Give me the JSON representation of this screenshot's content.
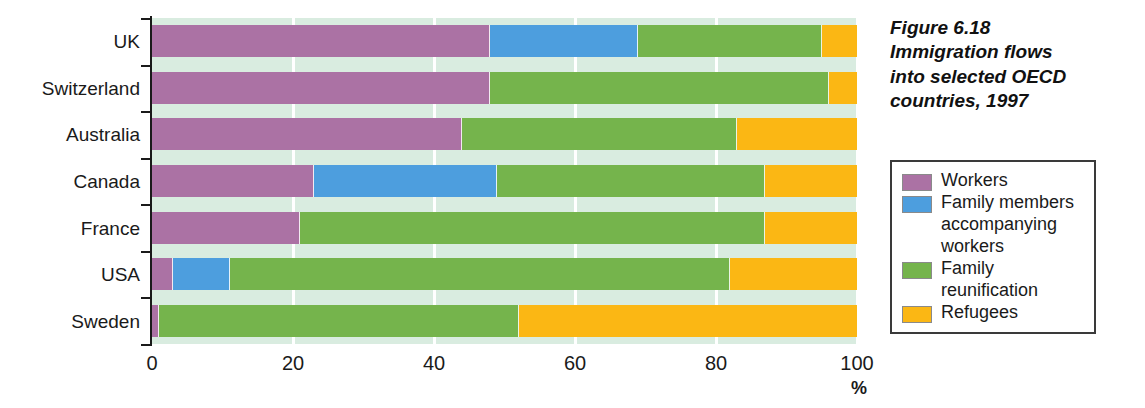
{
  "caption": {
    "line1": "Figure 6.18",
    "line2": "Immigration flows",
    "line3": "into selected OECD",
    "line4": "countries, 1997"
  },
  "legend": {
    "items": [
      {
        "label": "Workers",
        "key": "workers",
        "color": "#ab72a4"
      },
      {
        "label": "Family members",
        "label2": "accompanying",
        "label3": "workers",
        "key": "family-acc",
        "color": "#4d9ede"
      },
      {
        "label": "Family",
        "label2": "reunification",
        "key": "family-reu",
        "color": "#75b44c"
      },
      {
        "label": "Refugees",
        "key": "refugees",
        "color": "#fbb714"
      }
    ]
  },
  "axis": {
    "unit": "%",
    "ticks": [
      "0",
      "20",
      "40",
      "60",
      "80",
      "100"
    ]
  },
  "chart_data": {
    "type": "bar",
    "orientation": "horizontal",
    "stacked": true,
    "title": "Immigration flows into selected OECD countries, 1997",
    "xlabel": "%",
    "ylabel": "",
    "xlim": [
      0,
      100
    ],
    "xticks": [
      0,
      20,
      40,
      60,
      80,
      100
    ],
    "grid": true,
    "legend_position": "right",
    "categories": [
      "UK",
      "Switzerland",
      "Australia",
      "Canada",
      "France",
      "USA",
      "Sweden"
    ],
    "series": [
      {
        "name": "Workers",
        "color": "#ab72a4",
        "values": [
          48,
          48,
          44,
          23,
          21,
          3,
          1
        ]
      },
      {
        "name": "Family members accompanying workers",
        "color": "#4d9ede",
        "values": [
          21,
          0,
          0,
          26,
          0,
          8,
          0
        ]
      },
      {
        "name": "Family reunification",
        "color": "#75b44c",
        "values": [
          26,
          48,
          39,
          38,
          66,
          71,
          51
        ]
      },
      {
        "name": "Refugees",
        "color": "#fbb714",
        "values": [
          5,
          4,
          17,
          13,
          13,
          18,
          48
        ]
      }
    ],
    "rows": [
      {
        "label": "UK",
        "workers": 48,
        "family_accompanying": 21,
        "family_reunification": 26,
        "refugees": 5
      },
      {
        "label": "Switzerland",
        "workers": 48,
        "family_accompanying": 0,
        "family_reunification": 48,
        "refugees": 4
      },
      {
        "label": "Australia",
        "workers": 44,
        "family_accompanying": 0,
        "family_reunification": 39,
        "refugees": 17
      },
      {
        "label": "Canada",
        "workers": 23,
        "family_accompanying": 26,
        "family_reunification": 38,
        "refugees": 13
      },
      {
        "label": "France",
        "workers": 21,
        "family_accompanying": 0,
        "family_reunification": 66,
        "refugees": 13
      },
      {
        "label": "USA",
        "workers": 3,
        "family_accompanying": 8,
        "family_reunification": 71,
        "refugees": 18
      },
      {
        "label": "Sweden",
        "workers": 1,
        "family_accompanying": 0,
        "family_reunification": 51,
        "refugees": 48
      }
    ]
  }
}
